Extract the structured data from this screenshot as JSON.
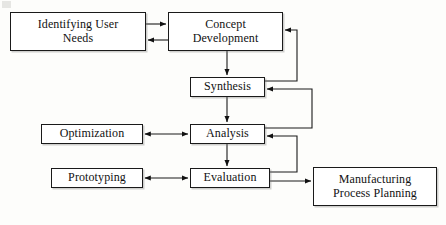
{
  "diagram": {
    "type": "flowchart",
    "background_color": "#fdfdfb",
    "line_color": "#1a1a1a",
    "box_fill": "#ffffff",
    "nodes": [
      {
        "id": "identifying-user-needs",
        "label": "Identifying User\nNeeds",
        "x": 10,
        "y": 12,
        "w": 136,
        "h": 39,
        "font_size": 12
      },
      {
        "id": "concept-development",
        "label": "Concept\nDevelopment",
        "x": 168,
        "y": 12,
        "w": 115,
        "h": 39,
        "font_size": 12
      },
      {
        "id": "synthesis",
        "label": "Synthesis",
        "x": 190,
        "y": 77,
        "w": 75,
        "h": 20,
        "font_size": 12
      },
      {
        "id": "optimization",
        "label": "Optimization",
        "x": 41,
        "y": 124,
        "w": 102,
        "h": 20,
        "font_size": 12
      },
      {
        "id": "analysis",
        "label": "Analysis",
        "x": 190,
        "y": 124,
        "w": 75,
        "h": 20,
        "font_size": 12
      },
      {
        "id": "prototyping",
        "label": "Prototyping",
        "x": 51,
        "y": 168,
        "w": 92,
        "h": 20,
        "font_size": 12
      },
      {
        "id": "evaluation",
        "label": "Evaluation",
        "x": 190,
        "y": 168,
        "w": 80,
        "h": 20,
        "font_size": 12
      },
      {
        "id": "manufacturing-process-planning",
        "label": "Manufacturing\nProcess Planning",
        "x": 313,
        "y": 167,
        "w": 124,
        "h": 39,
        "font_size": 12
      }
    ],
    "connectors": [
      {
        "id": "needs-to-concept",
        "from": "identifying-user-needs",
        "to": "concept-development",
        "kind": "arrow-right",
        "path": "M146,24 L166,24",
        "arrow_at": "end"
      },
      {
        "id": "concept-to-needs",
        "from": "concept-development",
        "to": "identifying-user-needs",
        "kind": "arrow-left",
        "path": "M168,40 L148,40",
        "arrow_at": "end"
      },
      {
        "id": "concept-to-synthesis",
        "from": "concept-development",
        "to": "synthesis",
        "kind": "arrow-down",
        "path": "M227,51 L227,75",
        "arrow_at": "end"
      },
      {
        "id": "synthesis-to-concept-feedback",
        "from": "synthesis",
        "to": "concept-development",
        "kind": "feedback-loop",
        "path": "M265,81 L297,81 L297,30 L285,30",
        "arrow_at": "end"
      },
      {
        "id": "synthesis-to-analysis",
        "from": "synthesis",
        "to": "analysis",
        "kind": "arrow-down",
        "path": "M227,97 L227,122",
        "arrow_at": "end"
      },
      {
        "id": "analysis-to-synthesis-feedback",
        "from": "analysis",
        "to": "synthesis",
        "kind": "feedback-loop",
        "path": "M265,128 L312,128 L312,89 L267,89",
        "arrow_at": "end"
      },
      {
        "id": "optimization-analysis",
        "from": "optimization",
        "to": "analysis",
        "kind": "double-arrow",
        "path": "M145,134 L188,134",
        "arrow_at": "both"
      },
      {
        "id": "analysis-to-evaluation",
        "from": "analysis",
        "to": "evaluation",
        "kind": "arrow-down",
        "path": "M227,144 L227,166",
        "arrow_at": "end"
      },
      {
        "id": "evaluation-to-analysis-feedback",
        "from": "evaluation",
        "to": "analysis",
        "kind": "feedback-loop",
        "path": "M270,172 L297,172 L297,136 L267,136",
        "arrow_at": "end"
      },
      {
        "id": "prototyping-evaluation",
        "from": "prototyping",
        "to": "evaluation",
        "kind": "double-arrow",
        "path": "M145,178 L188,178",
        "arrow_at": "both"
      },
      {
        "id": "evaluation-to-manufacturing",
        "from": "evaluation",
        "to": "manufacturing-process-planning",
        "kind": "arrow-right",
        "path": "M270,181 L311,181",
        "arrow_at": "end"
      }
    ]
  }
}
